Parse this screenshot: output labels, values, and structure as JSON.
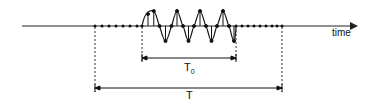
{
  "diagram": {
    "axis_label": "time",
    "inner_span_label": "T",
    "inner_span_sub": "0",
    "outer_span_label": "T",
    "colors": {
      "stroke": "#1a1a1a",
      "background": "#ffffff"
    }
  }
}
